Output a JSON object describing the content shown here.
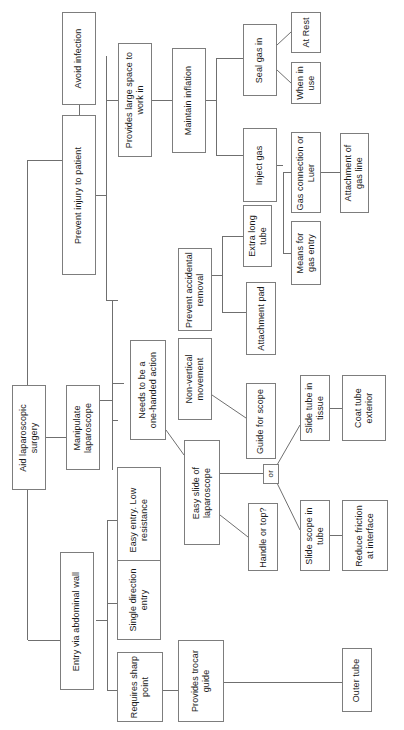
{
  "diagram": {
    "type": "tree-diagram",
    "orientation": "right-to-left, text rotated 90 degrees counter-clockwise",
    "line_color": "#6f6f6f",
    "box_border_color": "#7d7d7d",
    "background_color": "#ffffff",
    "text_color": "#1a1a1a"
  },
  "nodes": {
    "root": {
      "label": "Aid laparoscopic surgery"
    },
    "prevent_injury": {
      "label": "Prevent injury to patient"
    },
    "avoid_infection": {
      "label": "Avoid infection"
    },
    "provides_large_space": {
      "label": "Provides large space to work in"
    },
    "maintain_inflation": {
      "label": "Maintain inflation"
    },
    "seal_gas_in": {
      "label": "Seal gas in"
    },
    "at_rest": {
      "label": "At Rest"
    },
    "when_in_use": {
      "label": "When in use"
    },
    "inject_gas": {
      "label": "Inject gas"
    },
    "gas_connection": {
      "label": "Gas connection or Luer"
    },
    "attachment_gas_line": {
      "label": "Attachment of gas line"
    },
    "means_gas_entry": {
      "label": "Means for gas entry"
    },
    "manipulate_laparoscope": {
      "label": "Manipulate laparoscope"
    },
    "prevent_accidental_removal": {
      "label": "Prevent accidental removal"
    },
    "extra_long_tube": {
      "label": "Extra long tube"
    },
    "attachment_pad": {
      "label": "Attachment pad"
    },
    "non_vertical_movement": {
      "label": "Non-vertical movement"
    },
    "guide_for_scope": {
      "label": "Guide for scope"
    },
    "needs_one_handed": {
      "label": "Needs to be a one-handed action"
    },
    "easy_slide": {
      "label": "Easy slide of laparoscope"
    },
    "or_node": {
      "label": "or"
    },
    "slide_tube_tissue": {
      "label": "Slide tube in tissue"
    },
    "coat_tube_exterior": {
      "label": "Coat tube exterior"
    },
    "slide_scope_tube": {
      "label": "Slide scope in tube"
    },
    "reduce_friction": {
      "label": "Reduce friction at interface"
    },
    "handle_or_top": {
      "label": "Handle or top?"
    },
    "easy_entry": {
      "label": "Easy entry. Low resistance"
    },
    "entry_abdominal_wall": {
      "label": "Entry via abdominal wall"
    },
    "single_direction_entry": {
      "label": "Single direction entry"
    },
    "requires_sharp_point": {
      "label": "Requires sharp point"
    },
    "provides_trocar_guide": {
      "label": "Provides trocar guide"
    },
    "outer_tube": {
      "label": "Outer tube"
    }
  }
}
